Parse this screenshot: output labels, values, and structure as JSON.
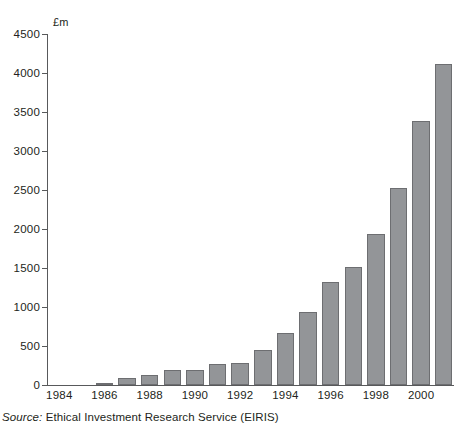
{
  "figure": {
    "unit_label": "£m",
    "source_prefix": "Source:",
    "source_text": " Ethical Investment Research Service (EIRIS)"
  },
  "chart_data": {
    "type": "bar",
    "title": "",
    "subtitle": "",
    "xlabel": "",
    "ylabel": "£m",
    "ylim": [
      0,
      4500
    ],
    "ytick_values": [
      0,
      500,
      1000,
      1500,
      2000,
      2500,
      3000,
      3500,
      4000,
      4500
    ],
    "ytick_labels": [
      "0",
      "500",
      "1000",
      "1500",
      "2000",
      "2500",
      "3000",
      "3500",
      "4000",
      "4500"
    ],
    "grid": false,
    "legend": "none",
    "bar_color": "#939598",
    "bar_edge_color": "#6d6e71",
    "axis_color": "#58595b",
    "xtick_labels": [
      "1984",
      "1986",
      "1988",
      "1990",
      "1992",
      "1994",
      "1996",
      "1998",
      "2000"
    ],
    "categories": [
      "1984",
      "1985",
      "1986",
      "1987",
      "1988",
      "1989",
      "1990",
      "1991",
      "1992",
      "1993",
      "1994",
      "1995",
      "1996",
      "1997",
      "1998",
      "1999",
      "2000",
      "2001"
    ],
    "values": [
      0,
      0,
      25,
      95,
      130,
      195,
      195,
      275,
      285,
      450,
      665,
      930,
      1325,
      1510,
      1935,
      2525,
      3380,
      4120
    ],
    "annotations": []
  }
}
